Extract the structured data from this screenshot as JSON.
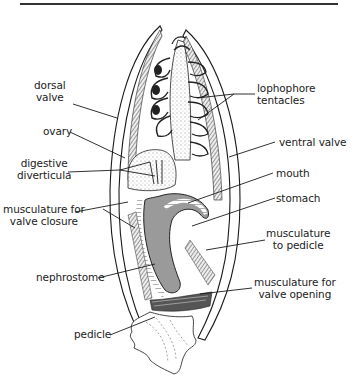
{
  "figure": {
    "labels": {
      "dorsal_valve": [
        "dorsal",
        "valve"
      ],
      "ovary": [
        "ovary"
      ],
      "digestive_diverticula": [
        "digestive",
        "diverticula"
      ],
      "musculature_valve_closure": [
        "musculature for",
        "valve closure"
      ],
      "nephrostome": [
        "nephrostome"
      ],
      "pedicle": [
        "pedicle"
      ],
      "lophophore_tentacles": [
        "lophophore",
        "tentacles"
      ],
      "ventral_valve": [
        "ventral valve"
      ],
      "mouth": [
        "mouth"
      ],
      "stomach": [
        "stomach"
      ],
      "musculature_to_pedicle": [
        "musculature",
        "to pedicle"
      ],
      "musculature_valve_opening": [
        "musculature for",
        "valve opening"
      ]
    },
    "colors": {
      "ink": "#1a1a1a",
      "label_text": "#222222",
      "gut_fill": "#9a9a9a",
      "stipple": "#cfcfcf",
      "background": "#ffffff"
    }
  }
}
